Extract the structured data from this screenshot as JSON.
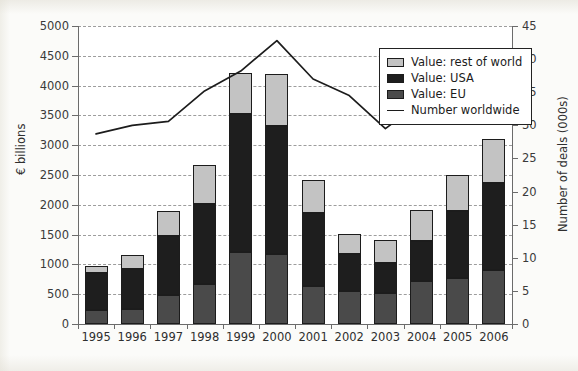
{
  "chart_data": {
    "type": "bar",
    "title": "",
    "subtitle": "",
    "xlabel": "",
    "ylabel": "€ billions",
    "y2label": "Number of deals (000s)",
    "categories": [
      "1995",
      "1996",
      "1997",
      "1998",
      "1999",
      "2000",
      "2001",
      "2002",
      "2003",
      "2004",
      "2005",
      "2006"
    ],
    "ylim": [
      0,
      5000
    ],
    "y2lim": [
      0,
      45
    ],
    "yticks": [
      0,
      500,
      1000,
      1500,
      2000,
      2500,
      3000,
      3500,
      4000,
      4500,
      5000
    ],
    "y2ticks": [
      0,
      5,
      10,
      15,
      20,
      25,
      30,
      35,
      40,
      45
    ],
    "grid": true,
    "stacked": true,
    "legend_position": "top-right",
    "series": [
      {
        "name": "Value: EU",
        "key": "eu",
        "color": "#4a4a4a",
        "axis": "left",
        "values": [
          230,
          250,
          480,
          670,
          1200,
          1170,
          640,
          550,
          520,
          730,
          780,
          910
        ]
      },
      {
        "name": "Value: USA",
        "key": "usa",
        "color": "#1e1e1e",
        "axis": "left",
        "values": [
          630,
          680,
          990,
          1340,
          2320,
          2150,
          1220,
          620,
          500,
          660,
          1110,
          1450
        ]
      },
      {
        "name": "Value: rest of world",
        "key": "row",
        "color": "#c3c3c3",
        "axis": "left",
        "values": [
          120,
          220,
          420,
          650,
          700,
          880,
          550,
          340,
          390,
          520,
          610,
          740
        ]
      },
      {
        "name": "Number worldwide",
        "key": "deals",
        "color": "#1c1c1c",
        "type": "line",
        "axis": "right",
        "values": [
          28.7,
          30.0,
          30.6,
          35.2,
          38.2,
          42.8,
          37.0,
          34.5,
          29.5,
          33.6,
          34.7,
          39.3
        ]
      }
    ],
    "totals": [
      980,
      1150,
      1890,
      2660,
      4220,
      4200,
      2410,
      1510,
      1410,
      1910,
      2500,
      3100
    ],
    "legend": [
      {
        "label": "Value: rest of world",
        "swatch": "row"
      },
      {
        "label": "Value: USA",
        "swatch": "usa"
      },
      {
        "label": "Value: EU",
        "swatch": "eu"
      },
      {
        "label": "Number worldwide",
        "swatch": "line"
      }
    ]
  },
  "colors": {
    "rest_of_world": "#c3c3c3",
    "usa": "#1e1e1e",
    "eu": "#4a4a4a",
    "line": "#1c1c1c",
    "grid": "#7d7d7d",
    "axis": "#6b6b6b",
    "plot_background": "#ffffff",
    "page_background": "#fbfbf9"
  }
}
